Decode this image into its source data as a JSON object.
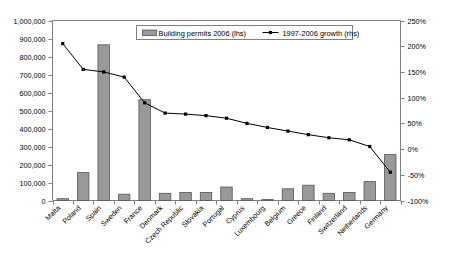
{
  "chart_data": {
    "type": "bar",
    "title": "",
    "subtitle": "",
    "xlabel": "",
    "ylabel": "",
    "y2label": "",
    "grid": false,
    "legend_position": "top-center",
    "categories": [
      "Malta",
      "Poland",
      "Spain",
      "Sweden",
      "France",
      "Denmark",
      "Czech Republic",
      "Slovakia",
      "Portugal",
      "Cyprus",
      "Luxembourg",
      "Belgium",
      "Greece",
      "Finland",
      "Switzerland",
      "Netherlands",
      "Germany"
    ],
    "series": [
      {
        "name": "Building permits 2006 (lhs)",
        "type": "bar",
        "axis": "left",
        "color": "#999999",
        "values": [
          10000,
          155000,
          865000,
          35000,
          560000,
          40000,
          45000,
          45000,
          75000,
          10000,
          5000,
          65000,
          85000,
          40000,
          45000,
          105000,
          255000
        ]
      },
      {
        "name": "1997-2006 growth (rhs)",
        "type": "line",
        "axis": "right",
        "color": "#000000",
        "values": [
          205,
          155,
          150,
          140,
          90,
          70,
          68,
          65,
          60,
          50,
          42,
          35,
          28,
          22,
          18,
          5,
          -45
        ]
      }
    ],
    "ylim": [
      0,
      1000000
    ],
    "yticks": [
      0,
      100000,
      200000,
      300000,
      400000,
      500000,
      600000,
      700000,
      800000,
      900000,
      1000000
    ],
    "ytick_labels": [
      "0",
      "100,000",
      "200,000",
      "300,000",
      "400,000",
      "500,000",
      "600,000",
      "700,000",
      "800,000",
      "900,000",
      "1,000,000"
    ],
    "y2lim": [
      -100,
      250
    ],
    "y2ticks": [
      -100,
      -50,
      0,
      50,
      100,
      150,
      200,
      250
    ],
    "y2tick_labels": [
      "-100%",
      "-50%",
      "0%",
      "50%",
      "100%",
      "150%",
      "200%",
      "250%"
    ]
  },
  "legend": {
    "entries": [
      {
        "label": "Building permits 2006 (lhs)",
        "marker": "bar-swatch"
      },
      {
        "label": "1997-2006 growth (rhs)",
        "marker": "line-marker"
      }
    ]
  }
}
